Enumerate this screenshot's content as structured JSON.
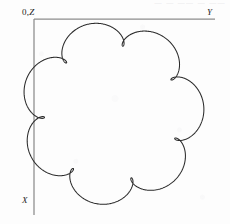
{
  "figure": {
    "kind": "mathematical-plot",
    "background_color": "#fdfdfd",
    "curve_color": "#2b2b2b",
    "axis_color": "#8c8c8c"
  },
  "labels": {
    "origin": "0,",
    "origin_var": "Z",
    "y_axis": "Y",
    "x_axis": "X"
  },
  "artifact": {
    "bleed_text": "— —  —— — ——"
  },
  "chart_data": {
    "type": "line",
    "title": "",
    "xlabel": "X",
    "ylabel": "Y",
    "zlabel": "Z",
    "grid": false,
    "legend": null,
    "axes": {
      "origin_px": [
        34,
        19
      ],
      "y_axis_end_px": [
        215,
        19
      ],
      "x_axis_end_px": [
        34,
        215
      ],
      "y_axis_direction": "right",
      "x_axis_direction": "down",
      "origin_label": "0, Z"
    },
    "curve": {
      "name": "epitrochoid",
      "closed": false,
      "petals": 7,
      "loops_at_cusps": 7,
      "center_px": [
        112,
        113
      ],
      "outer_radius_px": 92,
      "inner_radius_px": 55,
      "parametric_form": "x = (R+r)cos(t) - d*cos((R+r)/r * t);  y = (R+r)sin(t) - d*sin((R+r)/r * t)",
      "parameters": {
        "R": 7,
        "r": 1,
        "d": 1.22,
        "t_start": 0.0,
        "t_end": 6.62
      },
      "sample_count": 1400
    }
  }
}
